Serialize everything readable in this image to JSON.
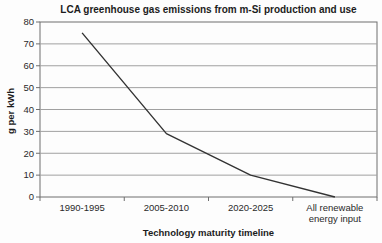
{
  "chart_data": {
    "type": "line",
    "title": "LCA greenhouse gas emissions from m-Si production and use",
    "xlabel": "Technology maturity timeline",
    "ylabel": "g per kWh",
    "categories": [
      "1990-1995",
      "2005-2010",
      "2020-2025",
      "All renewable\nenergy input"
    ],
    "values": [
      75,
      29,
      10,
      0
    ],
    "ylim": [
      0,
      80
    ],
    "ytick_step": 10,
    "yticks": [
      0,
      10,
      20,
      30,
      40,
      50,
      60,
      70,
      80
    ],
    "grid": "horizontal",
    "legend": "none",
    "colors": {
      "line": "#333333",
      "grid": "#a0a0a0",
      "axis": "#6e6e6e",
      "text": "#1c1c1c",
      "background": "#fdfdfd"
    }
  }
}
